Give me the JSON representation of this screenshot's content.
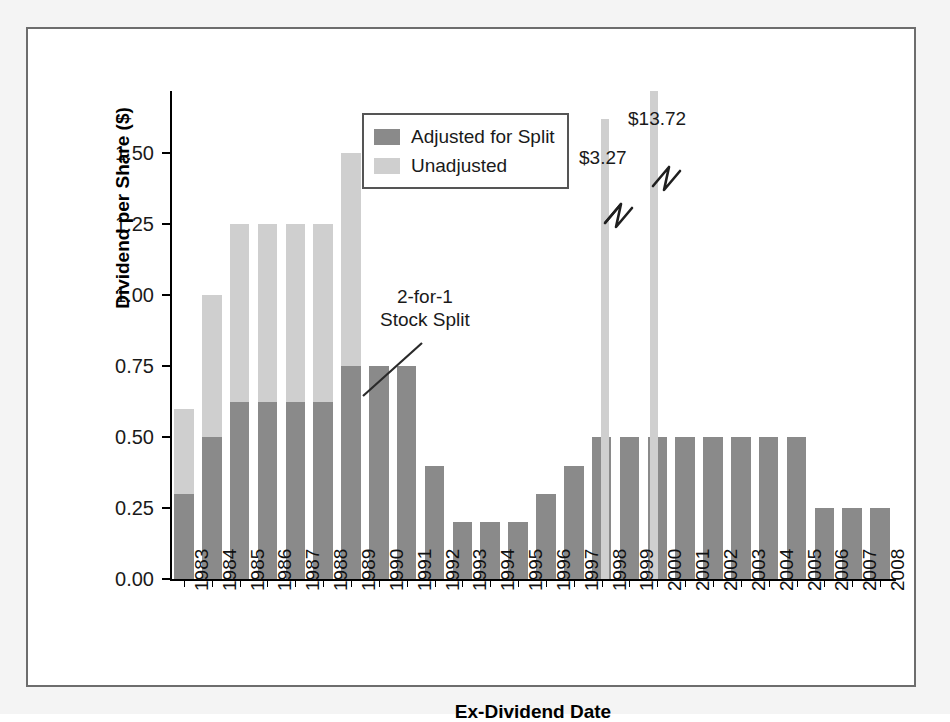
{
  "figure": {
    "y_axis_title": "Dividend per Share ($)",
    "x_axis_title": "Ex-Dividend Date",
    "split_annotation_line1": "2-for-1",
    "split_annotation_line2": "Stock Split",
    "spike_label_1": "$3.27",
    "spike_label_2": "$13.72",
    "colors": {
      "adjusted": "#8a8a8a",
      "unadjusted": "#cfcfcf",
      "axis": "#000000",
      "frame": "#6d6d6d",
      "mat": "#f4f4f4"
    }
  },
  "legend": {
    "position": "top-center",
    "entries": [
      {
        "label": "Adjusted for Split",
        "color": "#8a8a8a"
      },
      {
        "label": "Unadjusted",
        "color": "#cfcfcf"
      }
    ]
  },
  "y_axis": {
    "ticks": [
      "0.00",
      "0.25",
      "0.50",
      "0.75",
      "1.00",
      "1.25",
      "1.50"
    ],
    "min": 0.0,
    "max": 1.72
  },
  "x_axis": {
    "ticks": [
      "1983",
      "1984",
      "1985",
      "1986",
      "1987",
      "1988",
      "1989",
      "1990",
      "1991",
      "1992",
      "1993",
      "1994",
      "1995",
      "1996",
      "1997",
      "1998",
      "1999",
      "2000",
      "2001",
      "2002",
      "2003",
      "2004",
      "2005",
      "2006",
      "2007",
      "2008"
    ]
  },
  "chart_data": {
    "type": "bar",
    "title": "",
    "subtitle": "",
    "xlabel": "Ex-Dividend Date",
    "ylabel": "Dividend per Share ($)",
    "ylim": [
      0.0,
      1.72
    ],
    "grid": false,
    "legend_position": "top-center",
    "categories": [
      "1983",
      "1984",
      "1985",
      "1986",
      "1987",
      "1988",
      "1989",
      "1990",
      "1991",
      "1992",
      "1993",
      "1994",
      "1995",
      "1996",
      "1997",
      "1998",
      "1999",
      "2000",
      "2001",
      "2002",
      "2003",
      "2004",
      "2005",
      "2006",
      "2007",
      "2008"
    ],
    "series": [
      {
        "name": "Unadjusted",
        "color": "#cfcfcf",
        "values": [
          0.6,
          1.0,
          1.25,
          1.25,
          1.25,
          1.25,
          1.5,
          null,
          null,
          null,
          null,
          null,
          null,
          null,
          null,
          null,
          null,
          null,
          null,
          null,
          null,
          null,
          null,
          null,
          null,
          null
        ]
      },
      {
        "name": "Adjusted for Split",
        "color": "#8a8a8a",
        "values": [
          0.3,
          0.5,
          0.625,
          0.625,
          0.625,
          0.625,
          0.75,
          0.75,
          0.75,
          0.4,
          0.2,
          0.2,
          0.2,
          0.3,
          0.4,
          0.5,
          0.5,
          0.5,
          0.5,
          0.5,
          0.5,
          0.5,
          0.5,
          0.25,
          0.25,
          0.25
        ]
      }
    ],
    "annotations": [
      {
        "text": "2-for-1 Stock Split",
        "points_to": "1989",
        "value": 0.75
      },
      {
        "text": "$3.27",
        "points_to": "1997",
        "value": 3.27,
        "truncated": true
      },
      {
        "text": "$13.72",
        "points_to": "1999",
        "value": 13.72,
        "truncated": true
      }
    ]
  },
  "bars": [
    {
      "year": "1983",
      "light": 0.6,
      "dark": 0.3
    },
    {
      "year": "1984",
      "light": 1.0,
      "dark": 0.5
    },
    {
      "year": "1985",
      "light": 1.25,
      "dark": 0.625
    },
    {
      "year": "1986",
      "light": 1.25,
      "dark": 0.625
    },
    {
      "year": "1987",
      "light": 1.25,
      "dark": 0.625
    },
    {
      "year": "1988",
      "light": 1.25,
      "dark": 0.625
    },
    {
      "year": "1989",
      "light": 1.5,
      "dark": 0.75
    },
    {
      "year": "1990",
      "light": 0,
      "dark": 0.75
    },
    {
      "year": "1991",
      "light": 0,
      "dark": 0.75
    },
    {
      "year": "1992",
      "light": 0,
      "dark": 0.4
    },
    {
      "year": "1993",
      "light": 0,
      "dark": 0.2
    },
    {
      "year": "1994",
      "light": 0,
      "dark": 0.2
    },
    {
      "year": "1995",
      "light": 0,
      "dark": 0.2
    },
    {
      "year": "1996",
      "light": 0,
      "dark": 0.3
    },
    {
      "year": "1997",
      "light": 0,
      "dark": 0.4
    },
    {
      "year": "1998",
      "light": 0,
      "dark": 0.5
    },
    {
      "year": "1999",
      "light": 0,
      "dark": 0.5
    },
    {
      "year": "2000",
      "light": 0,
      "dark": 0.5
    },
    {
      "year": "2001",
      "light": 0,
      "dark": 0.5
    },
    {
      "year": "2002",
      "light": 0,
      "dark": 0.5
    },
    {
      "year": "2003",
      "light": 0,
      "dark": 0.5
    },
    {
      "year": "2004",
      "light": 0,
      "dark": 0.5
    },
    {
      "year": "2005",
      "light": 0,
      "dark": 0.5
    },
    {
      "year": "2006",
      "light": 0,
      "dark": 0.25
    },
    {
      "year": "2007",
      "light": 0,
      "dark": 0.25
    },
    {
      "year": "2008",
      "light": 0,
      "dark": 0.25
    }
  ],
  "spikes": [
    {
      "label": "$3.27",
      "year": "1997",
      "x_frac": 0.5955,
      "top_value": 1.62
    },
    {
      "label": "$13.72",
      "year": "1999",
      "x_frac": 0.6625,
      "top_value": 1.72
    }
  ]
}
